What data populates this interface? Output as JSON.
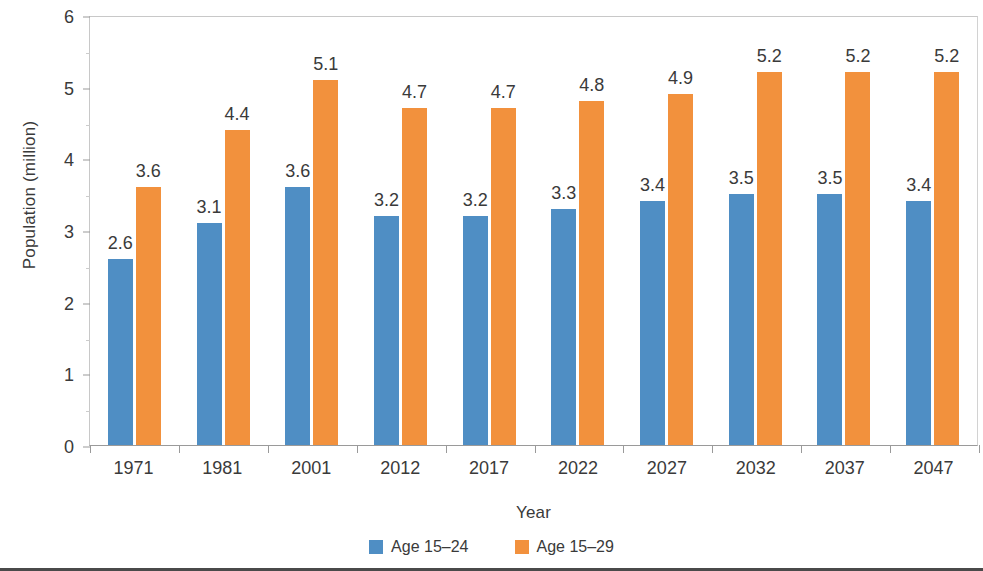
{
  "chart_data": {
    "type": "bar",
    "title": "",
    "xlabel": "Year",
    "ylabel": "Population (million)",
    "categories": [
      "1971",
      "1981",
      "2001",
      "2012",
      "2017",
      "2022",
      "2027",
      "2032",
      "2037",
      "2047"
    ],
    "series": [
      {
        "name": "Age 15–24",
        "color": "#4f8ec4",
        "values": [
          2.6,
          3.1,
          3.6,
          3.2,
          3.2,
          3.3,
          3.4,
          3.5,
          3.5,
          3.4
        ],
        "labels": [
          "2.6",
          "3.1",
          "3.6",
          "3.2",
          "3.2",
          "3.3",
          "3.4",
          "3.5",
          "3.5",
          "3.4"
        ]
      },
      {
        "name": "Age 15–29",
        "color": "#f2913d",
        "values": [
          3.6,
          4.4,
          5.1,
          4.7,
          4.7,
          4.8,
          4.9,
          5.2,
          5.2,
          5.2
        ],
        "labels": [
          "3.6",
          "4.4",
          "5.1",
          "4.7",
          "4.7",
          "4.8",
          "4.9",
          "5.2",
          "5.2",
          "5.2"
        ]
      }
    ],
    "ylim": [
      0,
      6
    ],
    "ytick_values": [
      0,
      1,
      2,
      3,
      4,
      5,
      6
    ],
    "ytick_labels": [
      "0",
      "1",
      "2",
      "3",
      "4",
      "5",
      "6"
    ],
    "grid": false,
    "legend_position": "bottom"
  }
}
